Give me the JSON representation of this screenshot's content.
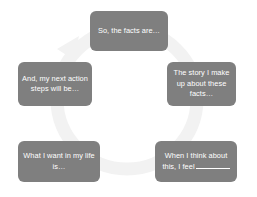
{
  "diagram": {
    "type": "cycle",
    "background_color": "#ffffff",
    "node_color": "#7f7f7f",
    "node_text_color": "#ffffff",
    "ring_color": "#f2f2f2",
    "direction": "clockwise",
    "nodes": [
      {
        "id": "facts",
        "position": "top",
        "label": "So, the facts are…"
      },
      {
        "id": "story",
        "position": "right",
        "label": "The story I make up about these facts…"
      },
      {
        "id": "feel",
        "position": "bottom-right",
        "label_before_blank": "When I think about this, I feel",
        "label_after_blank": ""
      },
      {
        "id": "want",
        "position": "bottom-left",
        "label": "What I want in my life is…"
      },
      {
        "id": "action",
        "position": "left",
        "label": "And, my next action steps will be…"
      }
    ]
  }
}
